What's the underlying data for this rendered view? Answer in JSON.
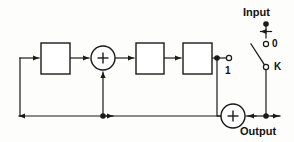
{
  "diagram": {
    "stroke_color": "#1a1a1a",
    "fill_color": "#ffffff",
    "background": "#fdfdfc",
    "labels": {
      "input": "Input",
      "output": "Output",
      "terminal_zero": "0",
      "terminal_k": "K",
      "terminal_one": "1"
    },
    "operators": {
      "adder_top": "+",
      "adder_bottom": "+"
    },
    "blocks": [
      {
        "name": "block-1",
        "label": "",
        "x": 41,
        "y": 43,
        "w": 29,
        "h": 31
      },
      {
        "name": "block-2",
        "label": "",
        "x": 136,
        "y": 43,
        "w": 28,
        "h": 31
      },
      {
        "name": "block-3",
        "label": "",
        "x": 183,
        "y": 43,
        "w": 29,
        "h": 31
      }
    ],
    "adders": [
      {
        "name": "adder-top",
        "cx": 103,
        "cy": 58,
        "r": 12,
        "sign": "+"
      },
      {
        "name": "adder-bottom",
        "cx": 233,
        "cy": 116,
        "r": 12,
        "sign": "+"
      }
    ],
    "terminals": [
      {
        "name": "terminal-input-dot",
        "cx": 266,
        "cy": 24,
        "type": "filled"
      },
      {
        "name": "terminal-zero",
        "cx": 266,
        "cy": 44,
        "type": "open"
      },
      {
        "name": "terminal-k",
        "cx": 266,
        "cy": 67,
        "type": "open"
      },
      {
        "name": "terminal-one",
        "cx": 229,
        "cy": 58,
        "type": "open"
      },
      {
        "name": "junction-upper-right",
        "cx": 217,
        "cy": 58,
        "type": "filled"
      },
      {
        "name": "junction-feedback-tap",
        "cx": 103,
        "cy": 116,
        "type": "filled"
      },
      {
        "name": "junction-output",
        "cx": 266,
        "cy": 116,
        "type": "filled"
      }
    ],
    "switch": {
      "name": "selector-switch",
      "pivot_x": 253,
      "pivot_y": 45,
      "contact_x": 264,
      "contact_y": 65,
      "position": "K"
    }
  }
}
